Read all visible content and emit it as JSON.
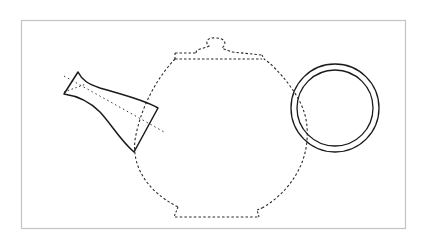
{
  "diagram": {
    "subject": "Teapot line drawing",
    "frame": {
      "x": 21,
      "y": 20,
      "width": 384,
      "height": 208,
      "stroke": "#c4c4c4"
    },
    "colors": {
      "line": "#1a1a1a",
      "dashed": "#2a2a2a",
      "background": "#ffffff"
    },
    "parts": [
      {
        "id": "lid-knob",
        "style": "dashed"
      },
      {
        "id": "lid",
        "style": "dashed"
      },
      {
        "id": "body",
        "style": "dashed"
      },
      {
        "id": "base",
        "style": "dashed"
      },
      {
        "id": "spout",
        "style": "solid"
      },
      {
        "id": "spout-axis",
        "style": "dotted"
      },
      {
        "id": "handle-ring",
        "style": "solid"
      }
    ],
    "handle": {
      "cx": 335,
      "cy": 108,
      "outer_r": 44,
      "inner_r": 38
    }
  }
}
